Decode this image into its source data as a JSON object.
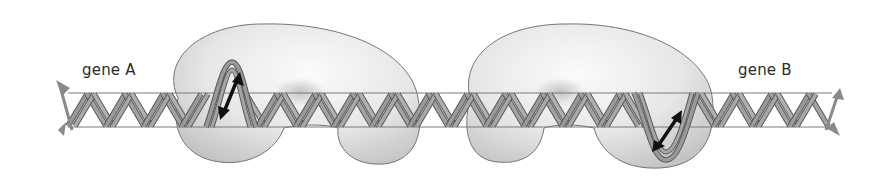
{
  "labels": {
    "gene_a": "gene A",
    "gene_b": "gene B"
  },
  "colors": {
    "background": "#ffffff",
    "rail": "#7a7a7a",
    "strand": "#8c8c8c",
    "strand_edge": "#5a5a5a",
    "protein_fill_light": "#f4f4f4",
    "protein_fill_dark": "#c4c4c4",
    "protein_edge": "#6a6a6a",
    "arrow": "#111111",
    "end_arrow": "#8a8a8a",
    "text": "#2a2a2a"
  },
  "geometry": {
    "rail_top_y": 93,
    "rail_bottom_y": 127,
    "rail_x_start": 68,
    "rail_x_end": 832,
    "helix_period": 38,
    "loop_a": {
      "x_start": 208,
      "x_end": 252,
      "peak_y": 63
    },
    "loop_b": {
      "x_start": 640,
      "x_end": 696,
      "trough_y": 158
    }
  }
}
